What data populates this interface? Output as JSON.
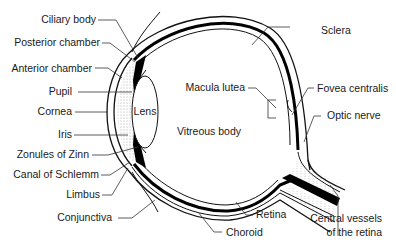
{
  "diagram": {
    "colors": {
      "background": "#ffffff",
      "line": "#111111",
      "text": "#1a1a1a"
    },
    "labels_left": [
      {
        "id": "ciliary-body",
        "text": "Ciliary body"
      },
      {
        "id": "posterior-chamber",
        "text": "Posterior chamber"
      },
      {
        "id": "anterior-chamber",
        "text": "Anterior chamber"
      },
      {
        "id": "pupil",
        "text": "Pupil"
      },
      {
        "id": "cornea",
        "text": "Cornea"
      },
      {
        "id": "iris",
        "text": "Iris"
      },
      {
        "id": "zonules-of-zinn",
        "text": "Zonules of Zinn"
      },
      {
        "id": "canal-of-schlemm",
        "text": "Canal of Schlemm"
      },
      {
        "id": "limbus",
        "text": "Limbus"
      },
      {
        "id": "conjunctiva",
        "text": "Conjunctiva"
      }
    ],
    "labels_inner": [
      {
        "id": "lens",
        "text": "Lens"
      },
      {
        "id": "vitreous-body",
        "text": "Vitreous body"
      },
      {
        "id": "macula-lutea",
        "text": "Macula lutea"
      }
    ],
    "labels_right": [
      {
        "id": "sclera",
        "text": "Sclera"
      },
      {
        "id": "fovea-centralis",
        "text": "Fovea centralis"
      },
      {
        "id": "optic-nerve",
        "text": "Optic nerve"
      },
      {
        "id": "central-vessels",
        "text_line1": "Central vessels",
        "text_line2": "of the retina"
      }
    ],
    "labels_bottom": [
      {
        "id": "retina",
        "text": "Retina"
      },
      {
        "id": "choroid",
        "text": "Choroid"
      }
    ]
  }
}
